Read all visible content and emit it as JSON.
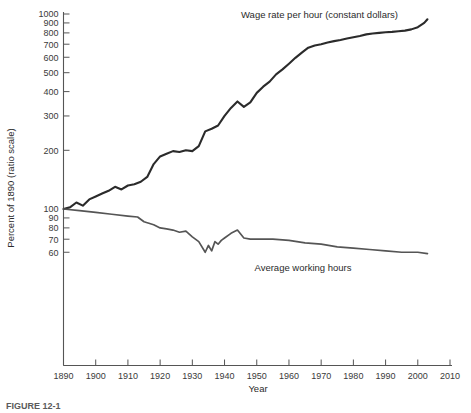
{
  "figure": {
    "caption_number": "FIGURE 12-1",
    "caption_text": ""
  },
  "axes": {
    "y_title": "Percent of 1890 (ratio scale)",
    "x_title": "Year",
    "y_ticks": [
      "1000",
      "900",
      "800",
      "700",
      "600",
      "500",
      "400",
      "300",
      "200",
      "100",
      "90",
      "80",
      "70",
      "60"
    ],
    "x_ticks": [
      "1890",
      "1900",
      "1910",
      "1920",
      "1930",
      "1940",
      "1950",
      "1960",
      "1970",
      "1980",
      "1990",
      "2000",
      "2010"
    ]
  },
  "labels": {
    "wage_series": "Wage rate per hour (constant dollars)",
    "hours_series": "Average working hours"
  },
  "colors": {
    "wage_line": "#2b2b2b",
    "hours_line": "#555555",
    "axis": "#555555",
    "text": "#2b2b2b",
    "background": "#ffffff"
  },
  "chart_data": {
    "type": "line",
    "title": "",
    "xlabel": "Year",
    "ylabel": "Percent of 1890 (ratio scale)",
    "yscale": "log",
    "ylim": [
      55,
      1000
    ],
    "xlim": [
      1890,
      2010
    ],
    "grid": false,
    "legend": "inline-annotations",
    "y_tick_values": [
      1000,
      900,
      800,
      700,
      600,
      500,
      400,
      300,
      200,
      100,
      90,
      80,
      70,
      60
    ],
    "x_tick_values": [
      1890,
      1900,
      1910,
      1920,
      1930,
      1940,
      1950,
      1960,
      1970,
      1980,
      1990,
      2000,
      2010
    ],
    "series": [
      {
        "name": "Wage rate per hour (constant dollars)",
        "color": "#2b2b2b",
        "x": [
          1890,
          1892,
          1894,
          1896,
          1898,
          1900,
          1902,
          1904,
          1906,
          1908,
          1910,
          1912,
          1914,
          1916,
          1918,
          1920,
          1922,
          1924,
          1926,
          1928,
          1930,
          1932,
          1934,
          1936,
          1938,
          1940,
          1942,
          1944,
          1946,
          1948,
          1950,
          1952,
          1954,
          1956,
          1958,
          1960,
          1962,
          1964,
          1966,
          1968,
          1970,
          1972,
          1974,
          1976,
          1978,
          1980,
          1982,
          1984,
          1986,
          1988,
          1990,
          1992,
          1994,
          1996,
          1998,
          2000,
          2002,
          2003
        ],
        "values": [
          100,
          102,
          108,
          104,
          112,
          116,
          120,
          124,
          130,
          126,
          132,
          134,
          138,
          146,
          170,
          186,
          192,
          198,
          196,
          200,
          198,
          210,
          250,
          258,
          268,
          300,
          330,
          356,
          334,
          352,
          394,
          424,
          450,
          490,
          520,
          556,
          596,
          634,
          672,
          690,
          700,
          714,
          726,
          736,
          748,
          760,
          772,
          786,
          794,
          800,
          806,
          810,
          816,
          822,
          834,
          856,
          900,
          940
        ]
      },
      {
        "name": "Average working hours",
        "color": "#555555",
        "x": [
          1890,
          1895,
          1900,
          1905,
          1910,
          1913,
          1915,
          1918,
          1920,
          1922,
          1924,
          1926,
          1928,
          1930,
          1932,
          1934,
          1935,
          1936,
          1937,
          1938,
          1939,
          1940,
          1942,
          1944,
          1946,
          1948,
          1950,
          1955,
          1960,
          1965,
          1970,
          1975,
          1980,
          1985,
          1990,
          1995,
          2000,
          2003
        ],
        "values": [
          100,
          98,
          96,
          94,
          92,
          91,
          86,
          83,
          80,
          79,
          78,
          76,
          77,
          72,
          68,
          60,
          65,
          61,
          68,
          66,
          69,
          71,
          75,
          78,
          71,
          70,
          70,
          70,
          69,
          67,
          66,
          64,
          63,
          62,
          61,
          60,
          60,
          59
        ]
      }
    ],
    "annotations": [
      {
        "text": "Wage rate per hour (constant dollars)",
        "x": 1952,
        "y": 1000
      },
      {
        "text": "Average working hours",
        "x": 1978,
        "y": 51
      }
    ]
  }
}
